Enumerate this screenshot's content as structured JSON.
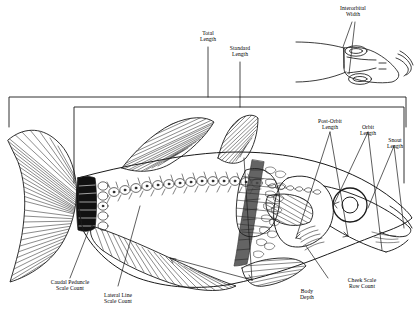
{
  "figure": {
    "ink_color": "#1a1a1a",
    "background_color": "#ffffff",
    "shading_color": "#555555",
    "dark_scale_color": "#111111"
  },
  "labels": {
    "total_length": "Total\nLength",
    "standard_length": "Standard\nLength",
    "interorbital_width": "Interorbital\nWidth",
    "post_orbit_length": "Post-Orbit\nLength",
    "orbit_length": "Orbit\nLength",
    "snout_length": "Snout\nLength",
    "caudal_peduncle_scale_count": "Caudal Peduncle\nScale Count",
    "lateral_line_scale_count": "Lateral Line\nScale Count",
    "body_depth": "Body\nDepth",
    "cheek_scale_row_count": "Cheek Scale\nRow Count"
  },
  "measurements": [
    {
      "id": "total-length",
      "label": "Total Length",
      "type": "bracket",
      "note": "outer bracket spanning from caudal fin tip to snout tip"
    },
    {
      "id": "standard-length",
      "label": "Standard Length",
      "type": "bracket",
      "note": "inner bracket spanning from caudal peduncle base to snout tip"
    },
    {
      "id": "interorbital-width",
      "label": "Interorbital Width",
      "type": "span",
      "note": "distance across the top of the head between the two orbits, shown on dorsal head inset"
    },
    {
      "id": "post-orbit-length",
      "label": "Post-Orbit Length",
      "type": "caliper",
      "note": "from rear margin of orbit to rear edge of operculum"
    },
    {
      "id": "orbit-length",
      "label": "Orbit Length",
      "type": "caliper",
      "note": "horizontal diameter of the eye orbit"
    },
    {
      "id": "snout-length",
      "label": "Snout Length",
      "type": "caliper",
      "note": "from front margin of orbit to tip of snout"
    },
    {
      "id": "body-depth",
      "label": "Body Depth",
      "type": "caliper",
      "note": "greatest vertical depth of the body"
    },
    {
      "id": "caudal-peduncle-scale-count",
      "label": "Caudal Peduncle Scale Count",
      "type": "pointer",
      "note": "count of darkened scales encircling the caudal peduncle"
    },
    {
      "id": "lateral-line-scale-count",
      "label": "Lateral Line Scale Count",
      "type": "pointer",
      "note": "count of pored scales along the lateral line"
    },
    {
      "id": "cheek-scale-row-count",
      "label": "Cheek Scale Row Count",
      "type": "pointer",
      "note": "count of scale rows on the cheek below the eye"
    }
  ]
}
